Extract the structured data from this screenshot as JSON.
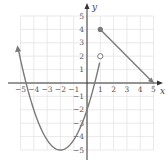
{
  "chart_data": {
    "type": "line",
    "title": "",
    "xlabel": "x",
    "ylabel": "y",
    "xlim": [
      -5,
      5
    ],
    "ylim": [
      -5,
      5
    ],
    "grid": true,
    "x_ticks": [
      "-5",
      "-4",
      "-3",
      "-2",
      "-1",
      "1",
      "2",
      "3",
      "4",
      "5"
    ],
    "y_ticks": [
      "5",
      "4",
      "3",
      "2",
      "1",
      "-1",
      "-2",
      "-3",
      "-4",
      "-5"
    ],
    "series": [
      {
        "name": "parabola piece",
        "kind": "curve",
        "equation_estimate": "y = 0.75(x+2)^2 - 5",
        "domain": "x < 1",
        "vertex": [
          -2,
          -5
        ],
        "points": [
          [
            -5,
            1.75
          ],
          [
            -4,
            -2
          ],
          [
            -3,
            -4.25
          ],
          [
            -2,
            -5
          ],
          [
            -1,
            -4.25
          ],
          [
            0,
            -2
          ],
          [
            1,
            1.75
          ]
        ],
        "left_end": "arrow",
        "right_end": {
          "point": [
            1,
            2
          ],
          "marker": "open-circle"
        }
      },
      {
        "name": "line piece",
        "kind": "segment",
        "domain": "x >= 1",
        "points": [
          [
            1,
            4
          ],
          [
            5,
            0
          ]
        ],
        "left_end": {
          "point": [
            1,
            4
          ],
          "marker": "closed-circle"
        },
        "right_end": "arrow"
      }
    ],
    "colors": {
      "curve": "#7a7a7a",
      "axes": "#333333",
      "grid": "#e6e6e6"
    }
  }
}
